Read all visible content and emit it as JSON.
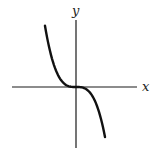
{
  "chart_data": {
    "type": "line",
    "title": "",
    "function": "y = -x^3",
    "xlabel": "x",
    "ylabel": "y",
    "xlim": [
      -1.45,
      1.55
    ],
    "ylim": [
      -1.25,
      1.75
    ],
    "grid": false,
    "legend": "none",
    "series": [
      {
        "name": "y = -x^3",
        "x_range": [
          -1.07,
          1.0
        ],
        "samples": 60
      }
    ],
    "colors": {
      "axis": "#1a1a1a",
      "curve": "#111111"
    }
  }
}
